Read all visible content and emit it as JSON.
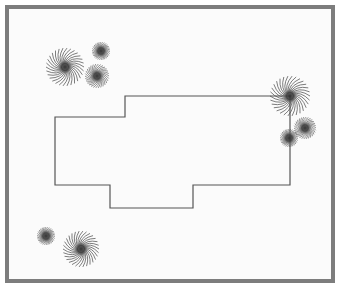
{
  "figure": {
    "background_color": "#fbfbfb",
    "page_color": "#ffffff",
    "frame": {
      "color": "#7d7d7d",
      "thickness": 4,
      "x": 5,
      "y": 5,
      "width": 330,
      "height": 278
    }
  },
  "footprint": {
    "name": "building-footprint",
    "stroke_color": "#555555",
    "stroke_width": 1.2,
    "fill_color": "none",
    "points": [
      [
        55,
        117
      ],
      [
        125,
        117
      ],
      [
        125,
        96
      ],
      [
        290,
        96
      ],
      [
        290,
        185
      ],
      [
        193,
        185
      ],
      [
        193,
        208
      ],
      [
        110,
        208
      ],
      [
        110,
        185
      ],
      [
        55,
        185
      ]
    ]
  },
  "markers": [
    {
      "name": "pinwheel-top-left-large",
      "kind": "pinwheel",
      "cx": 65,
      "cy": 67,
      "radius": 19,
      "spokes": 30,
      "core_radius": 5.5,
      "color": "#4a4a4a"
    },
    {
      "name": "dot-top-left-upper",
      "kind": "dot",
      "cx": 101,
      "cy": 51,
      "radius": 9,
      "spokes": 30,
      "core_radius": 5,
      "color": "#4a4a4a"
    },
    {
      "name": "dot-top-left-lower",
      "kind": "pinwheel-small",
      "cx": 97,
      "cy": 76,
      "radius": 12,
      "spokes": 30,
      "core_radius": 5,
      "color": "#4a4a4a"
    },
    {
      "name": "pinwheel-right-large",
      "kind": "pinwheel",
      "cx": 290,
      "cy": 96,
      "radius": 20,
      "spokes": 30,
      "core_radius": 5.5,
      "color": "#4a4a4a"
    },
    {
      "name": "pinwheel-right-small",
      "kind": "pinwheel-small",
      "cx": 305,
      "cy": 128,
      "radius": 11,
      "spokes": 30,
      "core_radius": 5,
      "color": "#4a4a4a"
    },
    {
      "name": "dot-right-inner",
      "kind": "dot",
      "cx": 289,
      "cy": 138,
      "radius": 9,
      "spokes": 30,
      "core_radius": 5,
      "color": "#4a4a4a"
    },
    {
      "name": "dot-bottom-left",
      "kind": "dot",
      "cx": 46,
      "cy": 236,
      "radius": 9,
      "spokes": 30,
      "core_radius": 5,
      "color": "#4a4a4a"
    },
    {
      "name": "pinwheel-bottom-left",
      "kind": "pinwheel",
      "cx": 81,
      "cy": 249,
      "radius": 18,
      "spokes": 30,
      "core_radius": 5.5,
      "color": "#4a4a4a"
    }
  ]
}
